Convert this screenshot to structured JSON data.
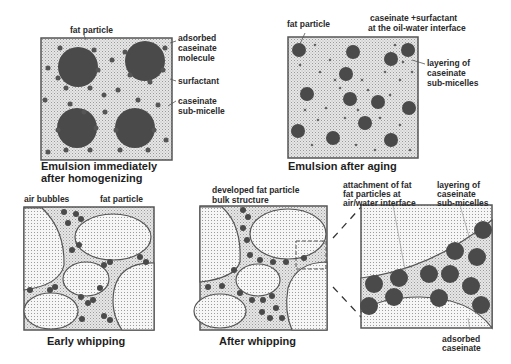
{
  "panels": [
    {
      "id": "p1",
      "caption": [
        "Emulsion immediately",
        "after homogenizing"
      ],
      "labels": {
        "fat_particle": "fat particle",
        "adsorbed": [
          "adsorbed",
          "caseinate",
          "molecule"
        ],
        "surfactant": "surfactant",
        "submicelle": [
          "caseinate",
          "sub-micelle"
        ]
      }
    },
    {
      "id": "p2",
      "caption": [
        "Emulsion after aging"
      ],
      "labels": {
        "fat_particle": "fat particle",
        "interface": [
          "caseinate +surfactant",
          "at the oil-water interface"
        ],
        "layering": [
          "layering of",
          "caseinate",
          "sub-micelles"
        ]
      }
    },
    {
      "id": "p3",
      "caption": [
        "Early whipping"
      ],
      "labels": {
        "air_bubbles": "air bubbles",
        "fat_particle": "fat particle"
      }
    },
    {
      "id": "p4",
      "caption": [
        "After whipping"
      ],
      "labels": {
        "developed": [
          "developed fat particle",
          "bulk structure"
        ]
      }
    },
    {
      "id": "p5",
      "caption": [],
      "labels": {
        "attachment": [
          "attachment of fat",
          "fat particles at",
          "air/water interface"
        ],
        "layering": [
          "layering of",
          "caseinate",
          "sub-micelles"
        ],
        "adsorbed": [
          "adsorbed",
          "caseinate"
        ]
      }
    }
  ],
  "colors": {
    "fat": "#4a4a4a",
    "frame": "#555555",
    "bg_dots": "#b8b8b8",
    "air": "#f2f2f2"
  }
}
